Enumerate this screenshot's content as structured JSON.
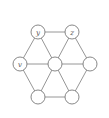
{
  "diagram": {
    "type": "graph",
    "colors": {
      "edge": "#8a8a8a",
      "node_stroke": "#7a7a7a",
      "node_fill": "#ffffff",
      "label": "#555555"
    },
    "nodes": [
      {
        "id": "n_y",
        "label": "y",
        "x": 38,
        "y": 32
      },
      {
        "id": "n_z",
        "label": "z",
        "x": 72,
        "y": 32
      },
      {
        "id": "n_v",
        "label": "v",
        "x": 20,
        "y": 64
      },
      {
        "id": "n_c",
        "label": "",
        "x": 55,
        "y": 64
      },
      {
        "id": "n_r",
        "label": "",
        "x": 90,
        "y": 64
      },
      {
        "id": "n_bl",
        "label": "",
        "x": 38,
        "y": 97
      },
      {
        "id": "n_br",
        "label": "",
        "x": 72,
        "y": 97
      }
    ],
    "edges": [
      [
        "n_y",
        "n_z"
      ],
      [
        "n_z",
        "n_r"
      ],
      [
        "n_r",
        "n_br"
      ],
      [
        "n_br",
        "n_bl"
      ],
      [
        "n_bl",
        "n_v"
      ],
      [
        "n_v",
        "n_y"
      ],
      [
        "n_c",
        "n_y"
      ],
      [
        "n_c",
        "n_z"
      ],
      [
        "n_c",
        "n_r"
      ],
      [
        "n_c",
        "n_br"
      ],
      [
        "n_c",
        "n_bl"
      ],
      [
        "n_c",
        "n_v"
      ]
    ]
  }
}
